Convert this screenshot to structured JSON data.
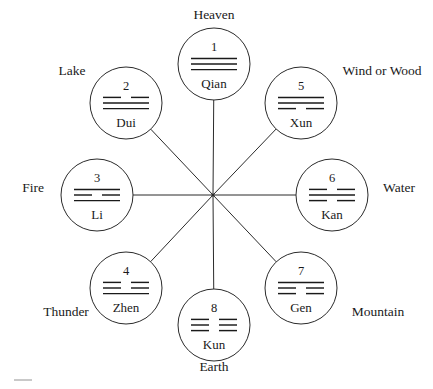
{
  "figure": {
    "background_color": "#ffffff",
    "stroke_color": "#2b2b2b",
    "text_color": "#1a1a1a",
    "center": {
      "x": 213,
      "y": 195
    },
    "circle_radius": 36,
    "spoke_radius": 130
  },
  "chart_data": {
    "type": "diagram",
    "layout": "radial eight-spoke hub with labeled circles",
    "center": {
      "x": 213,
      "y": 195
    },
    "legend_position": "outside each node",
    "nodes": [
      {
        "index": "1",
        "name": "Qian",
        "outer_label": "Heaven",
        "direction": "top",
        "angle_deg": 90,
        "glyph": "☰",
        "lines_top_to_bottom": [
          "solid",
          "solid",
          "solid"
        ],
        "cx": 214,
        "cy": 64,
        "label_x": 214,
        "label_y": 15
      },
      {
        "index": "2",
        "name": "Dui",
        "outer_label": "Lake",
        "direction": "top-left",
        "angle_deg": 135,
        "glyph": "☱",
        "lines_top_to_bottom": [
          "broken",
          "solid",
          "solid"
        ],
        "cx": 126,
        "cy": 103,
        "label_x": 72,
        "label_y": 71
      },
      {
        "index": "3",
        "name": "Li",
        "outer_label": "Fire",
        "direction": "left",
        "angle_deg": 180,
        "glyph": "☲",
        "lines_top_to_bottom": [
          "solid",
          "broken",
          "solid"
        ],
        "cx": 97,
        "cy": 195,
        "label_x": 33,
        "label_y": 188
      },
      {
        "index": "4",
        "name": "Zhen",
        "outer_label": "Thunder",
        "direction": "bottom-left",
        "angle_deg": 225,
        "glyph": "☳",
        "lines_top_to_bottom": [
          "broken",
          "broken",
          "solid"
        ],
        "cx": 126,
        "cy": 288,
        "label_x": 66,
        "label_y": 312
      },
      {
        "index": "5",
        "name": "Xun",
        "outer_label": "Wind or Wood",
        "direction": "top-right",
        "angle_deg": 45,
        "glyph": "☴",
        "lines_top_to_bottom": [
          "solid",
          "solid",
          "broken"
        ],
        "cx": 301,
        "cy": 103,
        "label_x": 382,
        "label_y": 71
      },
      {
        "index": "6",
        "name": "Kan",
        "outer_label": "Water",
        "direction": "right",
        "angle_deg": 0,
        "glyph": "☵",
        "lines_top_to_bottom": [
          "broken",
          "solid",
          "broken"
        ],
        "cx": 332,
        "cy": 195,
        "label_x": 399,
        "label_y": 188
      },
      {
        "index": "7",
        "name": "Gen",
        "outer_label": "Mountain",
        "direction": "bottom-right",
        "angle_deg": 315,
        "glyph": "☶",
        "lines_top_to_bottom": [
          "solid",
          "broken",
          "broken"
        ],
        "cx": 301,
        "cy": 288,
        "label_x": 378,
        "label_y": 312
      },
      {
        "index": "8",
        "name": "Kun",
        "outer_label": "Earth",
        "direction": "bottom",
        "angle_deg": 270,
        "glyph": "☷",
        "lines_top_to_bottom": [
          "broken",
          "broken",
          "broken"
        ],
        "cx": 214,
        "cy": 325,
        "label_x": 214,
        "label_y": 367
      }
    ]
  }
}
